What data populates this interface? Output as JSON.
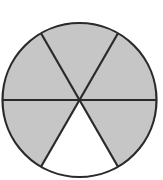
{
  "figure": {
    "shape": "circle",
    "total_parts": 6,
    "shaded_parts": 5,
    "unshaded_parts": 1,
    "fraction_shaded": "5/6",
    "unshaded_position": "bottom",
    "colors": {
      "shaded": "#c6c6c6",
      "unshaded": "#ffffff",
      "stroke": "#2a2a2a"
    }
  }
}
